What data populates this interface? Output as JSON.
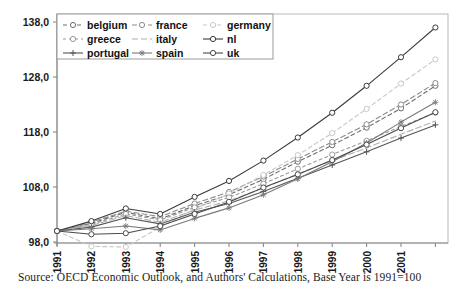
{
  "figure": {
    "caption": "Source: OECD Economic Outlook, and Authors' Calculations, Base Year is 1991=100"
  },
  "chart_data": {
    "type": "line",
    "title": "",
    "xlabel": "",
    "ylabel": "",
    "grid": false,
    "legend_position": "top-left",
    "ylim": [
      98.0,
      138.0
    ],
    "yticks": [
      "98,0",
      "108,0",
      "118,0",
      "128,0",
      "138,0"
    ],
    "ytick_values": [
      98.0,
      108.0,
      118.0,
      128.0,
      138.0
    ],
    "x": [
      1991,
      1992,
      1993,
      1994,
      1995,
      1996,
      1997,
      1998,
      1999,
      2000,
      2001,
      2002
    ],
    "xticklabels": [
      "1991",
      "1992",
      "1993",
      "1994",
      "1995",
      "1996",
      "1997",
      "1998",
      "1999",
      "2000",
      "2001"
    ],
    "series": [
      {
        "name": "belgium",
        "color": "#6d6d6d",
        "dash": "4,3",
        "marker": "circle",
        "values": [
          100.0,
          101.4,
          103.4,
          102.2,
          104.6,
          106.6,
          109.4,
          112.6,
          115.6,
          118.8,
          122.3,
          126.4
        ]
      },
      {
        "name": "france",
        "color": "#8c8c8c",
        "dash": "5,3",
        "marker": "circle",
        "values": [
          100.0,
          101.6,
          103.6,
          102.6,
          105.0,
          107.1,
          109.9,
          113.1,
          116.2,
          119.4,
          123.0,
          126.9
        ]
      },
      {
        "name": "germany",
        "color": "#c8c8c8",
        "dash": "4,3",
        "marker": "circle",
        "values": [
          100.0,
          97.2,
          97.1,
          100.7,
          104.0,
          106.8,
          110.2,
          113.8,
          117.8,
          122.2,
          126.8,
          131.2
        ]
      },
      {
        "name": "greece",
        "color": "#9a9a9a",
        "dash": "3,3",
        "marker": "circle",
        "values": [
          100.0,
          101.2,
          103.1,
          102.0,
          104.3,
          106.1,
          108.6,
          111.3,
          113.9,
          116.4,
          119.0,
          121.5
        ]
      },
      {
        "name": "italy",
        "color": "#b0b0b0",
        "dash": "6,3",
        "marker": "none",
        "values": [
          100.0,
          101.0,
          102.8,
          101.6,
          103.8,
          105.5,
          107.8,
          110.4,
          112.8,
          115.1,
          117.6,
          120.0
        ]
      },
      {
        "name": "nl",
        "color": "#3a3a3a",
        "dash": "0",
        "marker": "circle",
        "values": [
          100.0,
          101.8,
          104.1,
          103.1,
          106.2,
          109.1,
          112.8,
          117.0,
          121.5,
          126.4,
          131.6,
          137.0
        ]
      },
      {
        "name": "portugal",
        "color": "#555555",
        "dash": "0",
        "marker": "plus",
        "values": [
          100.0,
          100.7,
          102.4,
          101.3,
          103.4,
          105.0,
          107.2,
          109.6,
          112.0,
          114.4,
          116.9,
          119.3
        ]
      },
      {
        "name": "spain",
        "color": "#7a7a7a",
        "dash": "0",
        "marker": "star",
        "values": [
          100.0,
          100.4,
          100.9,
          100.2,
          102.3,
          104.2,
          106.6,
          109.5,
          112.6,
          116.0,
          119.8,
          123.4
        ]
      },
      {
        "name": "uk",
        "color": "#4a4a4a",
        "dash": "0",
        "marker": "circle",
        "values": [
          100.0,
          99.4,
          99.6,
          100.9,
          103.1,
          105.3,
          107.9,
          110.3,
          112.9,
          115.7,
          118.7,
          121.6
        ]
      }
    ]
  },
  "legend": {
    "entries": [
      {
        "label": "belgium"
      },
      {
        "label": "france"
      },
      {
        "label": "germany"
      },
      {
        "label": "greece"
      },
      {
        "label": "italy"
      },
      {
        "label": "nl"
      },
      {
        "label": "portugal"
      },
      {
        "label": "spain"
      },
      {
        "label": "uk"
      }
    ]
  }
}
